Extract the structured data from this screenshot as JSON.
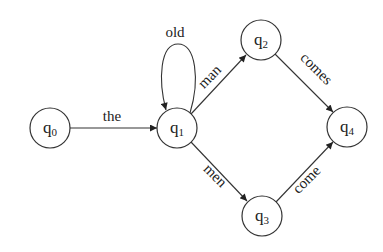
{
  "diagram": {
    "type": "finite-state-automaton",
    "colors": {
      "stroke": "#333333",
      "text": "#222222",
      "background": "#ffffff"
    },
    "states": [
      {
        "id": "q0",
        "base": "q",
        "sub": "0"
      },
      {
        "id": "q1",
        "base": "q",
        "sub": "1"
      },
      {
        "id": "q2",
        "base": "q",
        "sub": "2"
      },
      {
        "id": "q3",
        "base": "q",
        "sub": "3"
      },
      {
        "id": "q4",
        "base": "q",
        "sub": "4"
      }
    ],
    "transitions": [
      {
        "from": "q0",
        "to": "q1",
        "label": "the"
      },
      {
        "from": "q1",
        "to": "q1",
        "label": "old"
      },
      {
        "from": "q1",
        "to": "q2",
        "label": "man"
      },
      {
        "from": "q1",
        "to": "q3",
        "label": "men"
      },
      {
        "from": "q2",
        "to": "q4",
        "label": "comes"
      },
      {
        "from": "q3",
        "to": "q4",
        "label": "come"
      }
    ]
  }
}
